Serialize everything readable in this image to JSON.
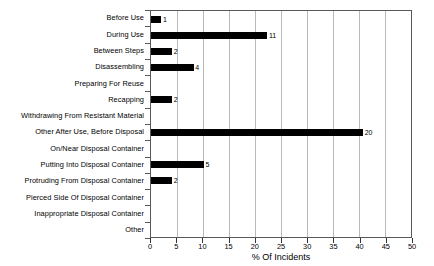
{
  "chart_data": {
    "type": "bar",
    "orientation": "horizontal",
    "title": "",
    "xlabel": "% Of Incidents",
    "ylabel": "",
    "xlim": [
      0,
      50
    ],
    "xticks": [
      0,
      5,
      10,
      15,
      20,
      25,
      30,
      35,
      40,
      45,
      50
    ],
    "grid": true,
    "legend": false,
    "bar_color": "#000000",
    "categories": [
      "Before Use",
      "During Use",
      "Between Steps",
      "Disassembling",
      "Preparing For Reuse",
      "Recapping",
      "Withdrawing From Resistant Material",
      "Other After Use, Before Disposal",
      "On/Near Disposal Container",
      "Putting Into Disposal Container",
      "Protruding From Disposal Container",
      "Pierced Side Of Disposal Container",
      "Inappropriate Disposal Container",
      "Other"
    ],
    "values": [
      2.0,
      22.4,
      4.1,
      8.2,
      0,
      4.1,
      0,
      40.8,
      0,
      10.2,
      4.1,
      0,
      0,
      0
    ],
    "data_labels": [
      "1",
      "11",
      "2",
      "4",
      "",
      "2",
      "",
      "20",
      "",
      "5",
      "2",
      "",
      "",
      ""
    ]
  }
}
